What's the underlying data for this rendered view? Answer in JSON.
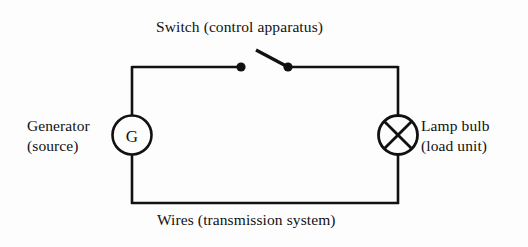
{
  "diagram": {
    "background_color": "#fdfdfd",
    "line_color": "#111111",
    "labels": {
      "switch": "Switch (control apparatus)",
      "generator_line1": "Generator",
      "generator_line2": "(source)",
      "lamp_line1": "Lamp bulb",
      "lamp_line2": "(load unit)",
      "wires": "Wires (transmission system)"
    },
    "symbols": {
      "generator_letter": "G",
      "generator_name": "generator-symbol",
      "lamp_name": "lamp-bulb-symbol",
      "switch_name": "switch-symbol",
      "wire_name": "circuit-wire"
    }
  }
}
